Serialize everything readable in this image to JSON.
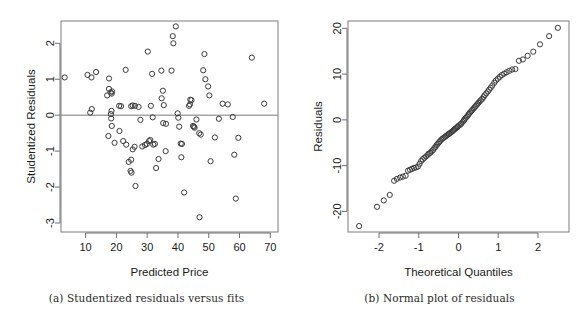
{
  "figure": {
    "panel_a_caption": "(a) Studentized residuals versus fits",
    "panel_b_caption": "(b) Normal plot of residuals"
  },
  "chart_data": [
    {
      "id": "panel-a",
      "type": "scatter",
      "title": "",
      "xlabel": "Predicted Price",
      "ylabel": "Studentized Residuals",
      "xlim": [
        2.0,
        72.5
      ],
      "ylim": [
        -3.25,
        2.62
      ],
      "xticks": [
        10,
        20,
        30,
        40,
        50,
        60,
        70
      ],
      "yticks": [
        2,
        1,
        0,
        -1,
        -2,
        -3
      ],
      "grid": false,
      "legend": "none",
      "reference_line": {
        "orientation": "horizontal",
        "y": 0
      },
      "marker": "open-circle",
      "points": [
        [
          3.2,
          1.05
        ],
        [
          10.6,
          1.12
        ],
        [
          11.9,
          1.05
        ],
        [
          13.4,
          1.2
        ],
        [
          12.0,
          0.17
        ],
        [
          11.5,
          0.07
        ],
        [
          17.6,
          1.02
        ],
        [
          17.0,
          0.55
        ],
        [
          17.6,
          0.73
        ],
        [
          18.1,
          0.63
        ],
        [
          18.5,
          0.6
        ],
        [
          18.6,
          0.66
        ],
        [
          17.4,
          -0.58
        ],
        [
          19.4,
          -0.77
        ],
        [
          18.2,
          0.03
        ],
        [
          18.3,
          -0.09
        ],
        [
          18.4,
          0.12
        ],
        [
          18.5,
          -0.3
        ],
        [
          20.9,
          0.26
        ],
        [
          21.5,
          0.25
        ],
        [
          21.0,
          -0.44
        ],
        [
          23.0,
          1.26
        ],
        [
          22.2,
          -0.72
        ],
        [
          23.2,
          -0.82
        ],
        [
          24.0,
          -1.3
        ],
        [
          24.8,
          -1.24
        ],
        [
          24.6,
          -1.55
        ],
        [
          24.9,
          -1.6
        ],
        [
          25.3,
          -0.95
        ],
        [
          25.9,
          -0.88
        ],
        [
          26.2,
          -1.97
        ],
        [
          24.8,
          0.25
        ],
        [
          25.3,
          0.27
        ],
        [
          26.0,
          0.26
        ],
        [
          27.2,
          0.23
        ],
        [
          27.8,
          -0.13
        ],
        [
          28.4,
          -0.87
        ],
        [
          29.3,
          -0.83
        ],
        [
          29.9,
          -0.8
        ],
        [
          30.6,
          -0.72
        ],
        [
          31.0,
          -0.69
        ],
        [
          30.2,
          1.77
        ],
        [
          31.6,
          1.15
        ],
        [
          31.2,
          0.26
        ],
        [
          31.8,
          -0.06
        ],
        [
          32.0,
          -0.82
        ],
        [
          32.5,
          -0.8
        ],
        [
          33.7,
          -1.22
        ],
        [
          32.9,
          -1.47
        ],
        [
          34.6,
          1.24
        ],
        [
          35.1,
          0.68
        ],
        [
          34.7,
          0.47
        ],
        [
          35.4,
          0.28
        ],
        [
          35.2,
          -0.22
        ],
        [
          36.1,
          -0.24
        ],
        [
          36.0,
          -1.0
        ],
        [
          37.9,
          1.24
        ],
        [
          38.3,
          2.2
        ],
        [
          38.5,
          2.0
        ],
        [
          39.3,
          2.47
        ],
        [
          39.9,
          0.05
        ],
        [
          40.1,
          -0.07
        ],
        [
          40.4,
          -0.32
        ],
        [
          40.9,
          -0.79
        ],
        [
          41.3,
          -0.8
        ],
        [
          41.1,
          -1.17
        ],
        [
          42.0,
          -2.15
        ],
        [
          43.6,
          0.26
        ],
        [
          43.9,
          0.3
        ],
        [
          44.0,
          0.43
        ],
        [
          44.4,
          0.42
        ],
        [
          44.9,
          -0.3
        ],
        [
          45.2,
          -0.32
        ],
        [
          45.4,
          -0.35
        ],
        [
          46.0,
          -0.12
        ],
        [
          46.9,
          -0.5
        ],
        [
          47.4,
          -0.54
        ],
        [
          47.0,
          -2.84
        ],
        [
          48.6,
          1.7
        ],
        [
          48.2,
          1.25
        ],
        [
          48.9,
          1.0
        ],
        [
          49.8,
          0.8
        ],
        [
          50.2,
          0.55
        ],
        [
          50.6,
          -1.28
        ],
        [
          52.0,
          -0.62
        ],
        [
          53.3,
          -0.1
        ],
        [
          54.5,
          0.32
        ],
        [
          56.2,
          0.3
        ],
        [
          57.8,
          -0.05
        ],
        [
          58.3,
          -1.1
        ],
        [
          58.8,
          -2.32
        ],
        [
          59.6,
          -0.63
        ],
        [
          64.0,
          1.6
        ],
        [
          68.0,
          0.32
        ]
      ]
    },
    {
      "id": "panel-b",
      "type": "scatter",
      "title": "",
      "xlabel": "Theoretical Quantiles",
      "ylabel": "Residuals",
      "xlim": [
        -2.78,
        2.78
      ],
      "ylim": [
        -24.5,
        21.6
      ],
      "xticks": [
        -2,
        -1,
        0,
        1,
        2
      ],
      "yticks": [
        20,
        10,
        0,
        -10,
        -20
      ],
      "grid": false,
      "legend": "none",
      "marker": "open-circle",
      "points": [
        [
          -2.5,
          -23.2
        ],
        [
          -2.05,
          -19.0
        ],
        [
          -1.88,
          -17.6
        ],
        [
          -1.73,
          -16.4
        ],
        [
          -1.62,
          -13.3
        ],
        [
          -1.55,
          -12.9
        ],
        [
          -1.47,
          -12.6
        ],
        [
          -1.4,
          -12.4
        ],
        [
          -1.33,
          -12.2
        ],
        [
          -1.27,
          -11.1
        ],
        [
          -1.22,
          -10.9
        ],
        [
          -1.17,
          -10.7
        ],
        [
          -1.12,
          -10.5
        ],
        [
          -1.07,
          -10.4
        ],
        [
          -1.02,
          -10.2
        ],
        [
          -0.98,
          -9.6
        ],
        [
          -0.94,
          -9.0
        ],
        [
          -0.9,
          -8.6
        ],
        [
          -0.86,
          -8.3
        ],
        [
          -0.82,
          -8.0
        ],
        [
          -0.78,
          -7.7
        ],
        [
          -0.75,
          -7.4
        ],
        [
          -0.71,
          -7.2
        ],
        [
          -0.68,
          -6.9
        ],
        [
          -0.64,
          -6.6
        ],
        [
          -0.61,
          -6.2
        ],
        [
          -0.58,
          -5.9
        ],
        [
          -0.55,
          -5.5
        ],
        [
          -0.52,
          -5.2
        ],
        [
          -0.49,
          -4.9
        ],
        [
          -0.46,
          -4.6
        ],
        [
          -0.43,
          -4.3
        ],
        [
          -0.4,
          -4.1
        ],
        [
          -0.37,
          -3.9
        ],
        [
          -0.34,
          -3.7
        ],
        [
          -0.31,
          -3.5
        ],
        [
          -0.28,
          -3.3
        ],
        [
          -0.25,
          -3.1
        ],
        [
          -0.23,
          -3.0
        ],
        [
          -0.2,
          -2.8
        ],
        [
          -0.17,
          -2.6
        ],
        [
          -0.14,
          -2.4
        ],
        [
          -0.12,
          -2.2
        ],
        [
          -0.09,
          -2.0
        ],
        [
          -0.06,
          -1.8
        ],
        [
          -0.03,
          -1.6
        ],
        [
          -0.01,
          -1.4
        ],
        [
          0.02,
          -1.2
        ],
        [
          0.05,
          -1.0
        ],
        [
          0.07,
          -0.8
        ],
        [
          0.1,
          -0.5
        ],
        [
          0.13,
          -0.2
        ],
        [
          0.15,
          0.1
        ],
        [
          0.18,
          0.4
        ],
        [
          0.21,
          0.7
        ],
        [
          0.24,
          1.0
        ],
        [
          0.26,
          1.3
        ],
        [
          0.29,
          1.6
        ],
        [
          0.32,
          1.9
        ],
        [
          0.35,
          2.2
        ],
        [
          0.38,
          2.5
        ],
        [
          0.41,
          2.8
        ],
        [
          0.44,
          3.1
        ],
        [
          0.47,
          3.4
        ],
        [
          0.5,
          3.7
        ],
        [
          0.53,
          4.0
        ],
        [
          0.56,
          4.3
        ],
        [
          0.6,
          4.6
        ],
        [
          0.63,
          5.0
        ],
        [
          0.66,
          5.4
        ],
        [
          0.7,
          5.8
        ],
        [
          0.74,
          6.2
        ],
        [
          0.77,
          6.6
        ],
        [
          0.81,
          7.0
        ],
        [
          0.85,
          7.5
        ],
        [
          0.9,
          8.1
        ],
        [
          0.94,
          8.6
        ],
        [
          0.99,
          9.0
        ],
        [
          1.04,
          9.4
        ],
        [
          1.09,
          9.8
        ],
        [
          1.15,
          10.1
        ],
        [
          1.21,
          10.4
        ],
        [
          1.28,
          10.7
        ],
        [
          1.35,
          11.0
        ],
        [
          1.43,
          11.1
        ],
        [
          1.52,
          12.9
        ],
        [
          1.62,
          13.2
        ],
        [
          1.74,
          14.0
        ],
        [
          1.88,
          14.9
        ],
        [
          2.05,
          16.5
        ],
        [
          2.28,
          18.3
        ],
        [
          2.5,
          20.1
        ]
      ]
    }
  ]
}
